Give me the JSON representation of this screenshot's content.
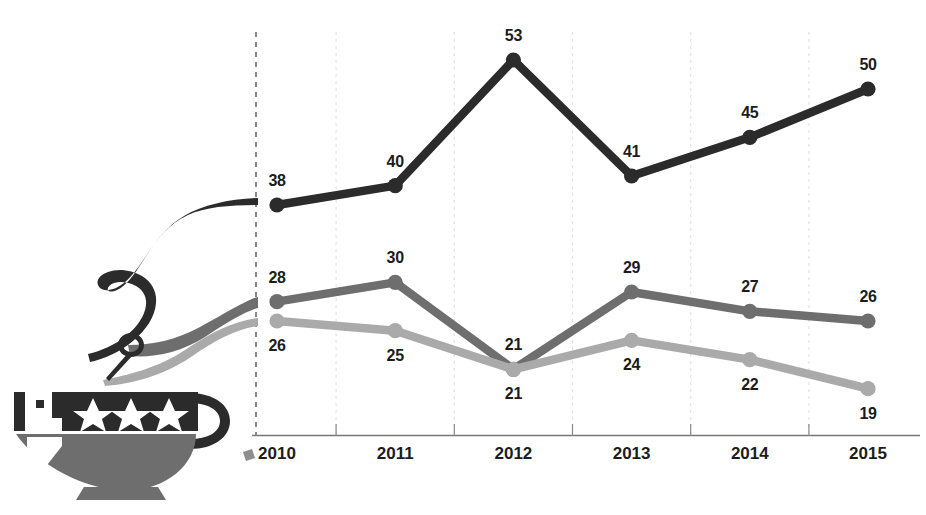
{
  "chart_data": {
    "type": "line",
    "title": "",
    "subtitle": "",
    "xlabel": "",
    "ylabel": "",
    "categories": [
      "2010",
      "2011",
      "2012",
      "2013",
      "2014",
      "2015"
    ],
    "ylim": [
      0,
      56
    ],
    "grid": "vertical-dashed-faint",
    "legend": "none",
    "series": [
      {
        "name": "series-dark",
        "color": "#2b2b2b",
        "values": [
          38,
          40,
          53,
          41,
          45,
          50
        ],
        "label_position": "above"
      },
      {
        "name": "series-medium-gray",
        "color": "#6e6e6e",
        "values": [
          28,
          30,
          21,
          29,
          27,
          26
        ],
        "label_position": "above"
      },
      {
        "name": "series-light-gray",
        "color": "#aaaaaa",
        "values": [
          26,
          25,
          21,
          24,
          22,
          19
        ],
        "label_position": "below"
      }
    ]
  },
  "axis": {
    "y_axis_style": "dashed",
    "x_axis_style": "solid",
    "tick_labels": [
      "2010",
      "2011",
      "2012",
      "2013",
      "2014",
      "2015"
    ]
  },
  "illustration": {
    "name": "teacup-with-stars",
    "star_count": 3,
    "cup_band_color": "#2b2b2b",
    "cup_bowl_color": "#6e6e6e",
    "steam_colors": [
      "#2b2b2b",
      "#6e6e6e",
      "#aaaaaa"
    ]
  },
  "colors": {
    "dark": "#2b2b2b",
    "medium": "#6e6e6e",
    "light": "#aaaaaa",
    "background": "#ffffff",
    "gridline": "#e3e3e3",
    "axis": "#555555"
  }
}
